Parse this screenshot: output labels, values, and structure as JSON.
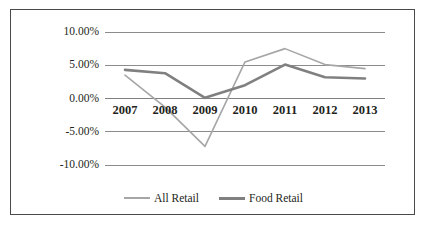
{
  "chart_data": {
    "type": "line",
    "title": "",
    "xlabel": "",
    "ylabel": "",
    "x": [
      "2007",
      "2008",
      "2009",
      "2010",
      "2011",
      "2012",
      "2013"
    ],
    "categories": [
      "2007",
      "2008",
      "2009",
      "2010",
      "2011",
      "2012",
      "2013"
    ],
    "series": [
      {
        "name": "All Retail",
        "color": "#a6a6a6",
        "line_width": 1.6,
        "values": [
          3.5,
          -1.3,
          -7.2,
          5.5,
          7.5,
          5.1,
          4.5
        ]
      },
      {
        "name": "Food Retail",
        "color": "#808080",
        "line_width": 2.6,
        "values": [
          4.3,
          3.8,
          0.1,
          2.0,
          5.1,
          3.2,
          3.0
        ]
      }
    ],
    "ylim": [
      -10,
      10
    ],
    "yticks": [
      10,
      5,
      0,
      -5,
      -10
    ],
    "ytick_labels": [
      "10.00%",
      "5.00%",
      "0.00%",
      "-5.00%",
      "-10.00%"
    ],
    "grid": "horizontal",
    "legend_position": "bottom",
    "axis_line_color": "#808080",
    "gridline_color": "#808080",
    "border_color": "#4a4a4a",
    "background_color": "#ffffff"
  },
  "legend": {
    "entries": [
      {
        "label": "All Retail"
      },
      {
        "label": "Food Retail"
      }
    ]
  }
}
